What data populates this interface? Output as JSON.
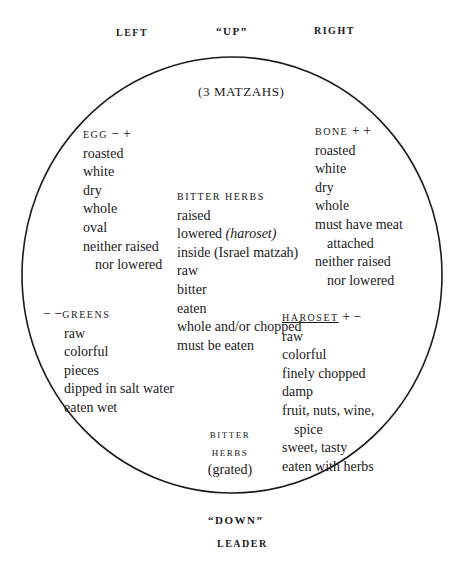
{
  "directions": {
    "left": "LEFT",
    "up": "“UP”",
    "right": "RIGHT",
    "down": "“DOWN”",
    "leader": "LEADER"
  },
  "plate": {
    "outline_color": "#1a1a1a",
    "matzahs": "(3 MATZAHS)"
  },
  "egg": {
    "title": "EGG",
    "signs": "− +",
    "items": [
      "roasted",
      "white",
      "dry",
      "whole",
      "oval",
      "neither raised",
      "nor lowered"
    ]
  },
  "bone": {
    "title": "BONE",
    "signs": "+ +",
    "items": [
      "roasted",
      "white",
      "dry",
      "whole",
      "must have meat",
      "attached",
      "neither raised",
      "nor lowered"
    ]
  },
  "bitter_herbs": {
    "title": "BITTER HERBS",
    "items": [
      "raised",
      "lowered",
      "(haroset)",
      "inside (Israel matzah)",
      "raw",
      "bitter",
      "eaten",
      "whole and/or chopped",
      "must be eaten"
    ]
  },
  "greens": {
    "signs": "− −",
    "title": "GREENS",
    "items": [
      "raw",
      "colorful",
      "pieces",
      "dipped in salt water",
      "eaten wet"
    ]
  },
  "haroset": {
    "title": "HAROSET",
    "signs": "+ −",
    "items": [
      "raw",
      "colorful",
      "finely chopped",
      "damp",
      "fruit, nuts, wine,",
      "spice",
      "sweet, tasty",
      "eaten with herbs"
    ]
  },
  "bitter_herbs_grated": {
    "line1": "BITTER",
    "line2": "HERBS",
    "line3": "(grated)"
  }
}
